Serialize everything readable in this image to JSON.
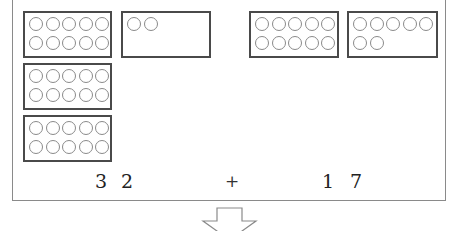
{
  "figure": {
    "type": "base-ten addition model",
    "left_operand": {
      "label_tens": "3",
      "label_ones": "2",
      "value": 32,
      "boxes": [
        {
          "id": "left-ten-1",
          "dots": 10
        },
        {
          "id": "left-ones",
          "dots": 2
        },
        {
          "id": "left-ten-2",
          "dots": 10
        },
        {
          "id": "left-ten-3",
          "dots": 10
        }
      ]
    },
    "operator": "+",
    "right_operand": {
      "label_tens": "1",
      "label_ones": "7",
      "value": 17,
      "boxes": [
        {
          "id": "right-ten-1",
          "dots": 10
        },
        {
          "id": "right-ones",
          "dots": 7
        }
      ]
    },
    "arrow": "down-arrow",
    "colors": {
      "box_border": "#4a4a4a",
      "dot_border": "#8a8a8a",
      "frame_border": "#8a8a8a"
    }
  }
}
